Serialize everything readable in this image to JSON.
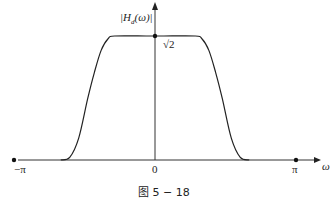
{
  "chart_data": {
    "type": "line",
    "title": "",
    "caption": "图 5 − 18",
    "xlabel": "ω",
    "ylabel": "|H_d(ω)|",
    "x_ticks": [
      {
        "value": -3.14159,
        "label": "−π"
      },
      {
        "value": 0,
        "label": "0"
      },
      {
        "value": 3.14159,
        "label": "π"
      }
    ],
    "y_ticks": [
      {
        "value": 1.41421,
        "label": "√2"
      }
    ],
    "xlim": [
      -3.6,
      3.6
    ],
    "ylim": [
      0,
      1.75
    ],
    "series": [
      {
        "name": "|H_d(ω)|",
        "x": [
          -2.1,
          -1.9,
          -1.7,
          -1.5,
          -1.35,
          -1.2,
          -1.05,
          -0.9,
          -0.2,
          0,
          0.2,
          0.9,
          1.05,
          1.2,
          1.35,
          1.5,
          1.7,
          1.9,
          2.1
        ],
        "y": [
          0,
          0.03,
          0.25,
          0.7,
          1.0,
          1.25,
          1.38,
          1.41421,
          1.41421,
          1.41421,
          1.41421,
          1.41421,
          1.38,
          1.25,
          1.0,
          0.7,
          0.25,
          0.03,
          0
        ]
      }
    ],
    "markers": [
      {
        "x": -3.14159,
        "y": 0
      },
      {
        "x": 3.14159,
        "y": 0
      },
      {
        "x": 0,
        "y": 1.41421
      }
    ],
    "grid": false,
    "legend": "none"
  },
  "labels": {
    "y_axis": "|H",
    "y_axis_sub": "d",
    "y_axis_tail": "(ω)|",
    "sqrt2": "√2",
    "origin": "0",
    "neg_pi": "−π",
    "pi": "π",
    "omega": "ω",
    "caption": "图 5 − 18"
  }
}
